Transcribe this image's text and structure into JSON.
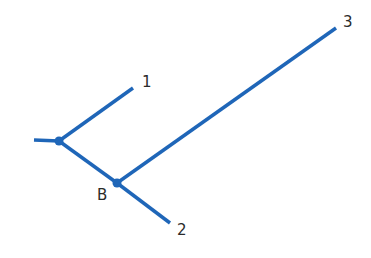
{
  "diagram": {
    "type": "phylogenetic-tree",
    "line_color": "#1f66b8",
    "label_color": "#2b2b2b",
    "root_stub": {
      "x1": 34,
      "y1": 140,
      "x2": 59,
      "y2": 141
    },
    "nodes": [
      {
        "id": "root-node",
        "x": 59,
        "y": 141,
        "label": ""
      },
      {
        "id": "node-B",
        "x": 117,
        "y": 183,
        "label": "B"
      }
    ],
    "leaves": [
      {
        "id": "leaf-1",
        "x": 133,
        "y": 88,
        "label": "1"
      },
      {
        "id": "leaf-2",
        "x": 170,
        "y": 223,
        "label": "2"
      },
      {
        "id": "leaf-3",
        "x": 336,
        "y": 28,
        "label": "3"
      }
    ],
    "labels": {
      "node_B": "B",
      "leaf_1": "1",
      "leaf_2": "2",
      "leaf_3": "3"
    }
  }
}
